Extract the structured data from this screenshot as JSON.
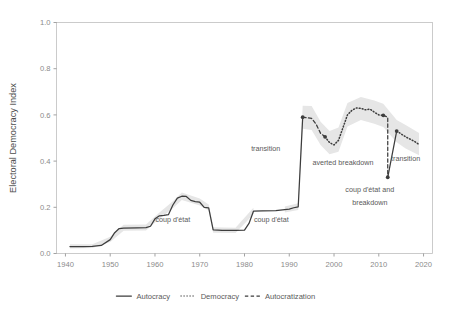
{
  "chart_data": {
    "type": "line",
    "title": "",
    "subtitle": "",
    "xlabel": "",
    "ylabel": "Electoral Democracy Index",
    "xlim": [
      1938,
      2022
    ],
    "ylim": [
      0.0,
      1.0
    ],
    "grid": false,
    "legend_position": "bottom",
    "x_ticks": [
      1940,
      1950,
      1960,
      1970,
      1980,
      1990,
      2000,
      2010,
      2020
    ],
    "x_tick_labels": [
      "1940",
      "1950",
      "1960",
      "1970",
      "1980",
      "1990",
      "2000",
      "2010",
      "2020"
    ],
    "y_ticks": [
      0.0,
      0.2,
      0.4,
      0.6,
      0.8,
      1.0
    ],
    "y_tick_labels": [
      "0.0",
      "0.2",
      "0.4",
      "0.6",
      "0.8",
      "1.0"
    ],
    "colors": {
      "line": "#3d3d3d",
      "confidence_band": "#e6e6e6",
      "axis_text": "#8a8a8a",
      "panel_border": "#bfbfbf",
      "annotation_text": "#5a5a5a"
    },
    "series": [
      {
        "name": "Autocracy",
        "style": "solid",
        "points": [
          [
            1941,
            0.03
          ],
          [
            1944,
            0.03
          ],
          [
            1946,
            0.031
          ],
          [
            1948,
            0.035
          ],
          [
            1950,
            0.06
          ],
          [
            1951,
            0.09
          ],
          [
            1952,
            0.108
          ],
          [
            1953,
            0.11
          ],
          [
            1956,
            0.111
          ],
          [
            1958,
            0.112
          ],
          [
            1959,
            0.118
          ],
          [
            1960,
            0.15
          ],
          [
            1961,
            0.163
          ],
          [
            1962,
            0.165
          ],
          [
            1963,
            0.168
          ],
          [
            1964,
            0.21
          ],
          [
            1965,
            0.24
          ],
          [
            1966,
            0.248
          ],
          [
            1967,
            0.247
          ],
          [
            1968,
            0.23
          ],
          [
            1969,
            0.225
          ],
          [
            1970,
            0.222
          ],
          [
            1971,
            0.2
          ],
          [
            1972,
            0.198
          ],
          [
            1973,
            0.102
          ],
          [
            1975,
            0.1
          ],
          [
            1978,
            0.1
          ],
          [
            1980,
            0.101
          ],
          [
            1981,
            0.13
          ],
          [
            1982,
            0.183
          ],
          [
            1984,
            0.185
          ],
          [
            1987,
            0.186
          ],
          [
            1989,
            0.19
          ],
          [
            1990,
            0.192
          ],
          [
            1991,
            0.198
          ],
          [
            1992,
            0.202
          ],
          [
            1993,
            0.59
          ]
        ]
      },
      {
        "name": "Autocratization",
        "style": "dashed",
        "points": [
          [
            1993,
            0.59
          ],
          [
            1995,
            0.585
          ],
          [
            1996,
            0.56
          ],
          [
            1997,
            0.52
          ],
          [
            1998,
            0.505
          ]
        ]
      },
      {
        "name": "Democracy",
        "style": "dotted",
        "points": [
          [
            1998,
            0.505
          ],
          [
            1999,
            0.48
          ],
          [
            2000,
            0.47
          ],
          [
            2001,
            0.49
          ],
          [
            2002,
            0.545
          ],
          [
            2003,
            0.6
          ],
          [
            2004,
            0.62
          ],
          [
            2005,
            0.63
          ],
          [
            2006,
            0.628
          ],
          [
            2007,
            0.622
          ],
          [
            2008,
            0.625
          ],
          [
            2009,
            0.612
          ],
          [
            2010,
            0.6
          ],
          [
            2011,
            0.598
          ]
        ]
      },
      {
        "name": "Autocratization",
        "style": "dashed",
        "points": [
          [
            2011,
            0.598
          ],
          [
            2012,
            0.59
          ],
          [
            2012,
            0.33
          ]
        ]
      },
      {
        "name": "Autocracy",
        "style": "solid",
        "points": [
          [
            2012,
            0.33
          ],
          [
            2014,
            0.53
          ]
        ]
      },
      {
        "name": "Democracy",
        "style": "dotted",
        "points": [
          [
            2014,
            0.53
          ],
          [
            2016,
            0.505
          ],
          [
            2018,
            0.485
          ],
          [
            2019,
            0.472
          ]
        ]
      }
    ],
    "confidence_bands": [
      {
        "x": 1941,
        "lo": 0.022,
        "hi": 0.04
      },
      {
        "x": 1946,
        "lo": 0.024,
        "hi": 0.04
      },
      {
        "x": 1950,
        "lo": 0.05,
        "hi": 0.072
      },
      {
        "x": 1953,
        "lo": 0.098,
        "hi": 0.124
      },
      {
        "x": 1958,
        "lo": 0.1,
        "hi": 0.126
      },
      {
        "x": 1961,
        "lo": 0.15,
        "hi": 0.178
      },
      {
        "x": 1964,
        "lo": 0.196,
        "hi": 0.226
      },
      {
        "x": 1966,
        "lo": 0.232,
        "hi": 0.264
      },
      {
        "x": 1970,
        "lo": 0.208,
        "hi": 0.238
      },
      {
        "x": 1972,
        "lo": 0.186,
        "hi": 0.212
      },
      {
        "x": 1973,
        "lo": 0.09,
        "hi": 0.114
      },
      {
        "x": 1978,
        "lo": 0.089,
        "hi": 0.112
      },
      {
        "x": 1982,
        "lo": 0.17,
        "hi": 0.198
      },
      {
        "x": 1989,
        "lo": 0.177,
        "hi": 0.204
      },
      {
        "x": 1992,
        "lo": 0.188,
        "hi": 0.218
      },
      {
        "x": 1993,
        "lo": 0.54,
        "hi": 0.64
      },
      {
        "x": 1995,
        "lo": 0.535,
        "hi": 0.638
      },
      {
        "x": 1997,
        "lo": 0.47,
        "hi": 0.57
      },
      {
        "x": 1999,
        "lo": 0.43,
        "hi": 0.53
      },
      {
        "x": 2001,
        "lo": 0.44,
        "hi": 0.545
      },
      {
        "x": 2003,
        "lo": 0.55,
        "hi": 0.652
      },
      {
        "x": 2006,
        "lo": 0.578,
        "hi": 0.678
      },
      {
        "x": 2009,
        "lo": 0.562,
        "hi": 0.662
      },
      {
        "x": 2011,
        "lo": 0.548,
        "hi": 0.648
      },
      {
        "x": 2014,
        "lo": 0.482,
        "hi": 0.578
      },
      {
        "x": 2016,
        "lo": 0.455,
        "hi": 0.556
      },
      {
        "x": 2019,
        "lo": 0.425,
        "hi": 0.522
      }
    ],
    "markers": [
      {
        "x": 1993,
        "y": 0.59
      },
      {
        "x": 1998,
        "y": 0.505
      },
      {
        "x": 2011,
        "y": 0.598
      },
      {
        "x": 2012,
        "y": 0.33
      },
      {
        "x": 2014,
        "y": 0.53
      }
    ],
    "annotations": [
      {
        "id": "transition-1",
        "text": "transition",
        "x": 1988,
        "y": 0.445,
        "anchor": "end"
      },
      {
        "id": "averted-breakdown",
        "text": "averted breakdown",
        "x": 2002,
        "y": 0.385,
        "anchor": "middle"
      },
      {
        "id": "coup-breakdown-line1",
        "text": "coup d'état and",
        "x": 2008,
        "y": 0.268,
        "anchor": "middle"
      },
      {
        "id": "coup-breakdown-line2",
        "text": "breakdown",
        "x": 2008,
        "y": 0.212,
        "anchor": "middle"
      },
      {
        "id": "transition-2",
        "text": "transition",
        "x": 2016,
        "y": 0.4,
        "anchor": "middle"
      },
      {
        "id": "coup-detat-1",
        "text": "coup d'état",
        "x": 1964,
        "y": 0.138,
        "anchor": "middle"
      },
      {
        "id": "coup-detat-2",
        "text": "coup d'état",
        "x": 1986,
        "y": 0.138,
        "anchor": "middle"
      }
    ],
    "legend": [
      {
        "label": "Autocracy",
        "style": "solid"
      },
      {
        "label": "Democracy",
        "style": "dotted"
      },
      {
        "label": "Autocratization",
        "style": "dashed"
      }
    ]
  }
}
